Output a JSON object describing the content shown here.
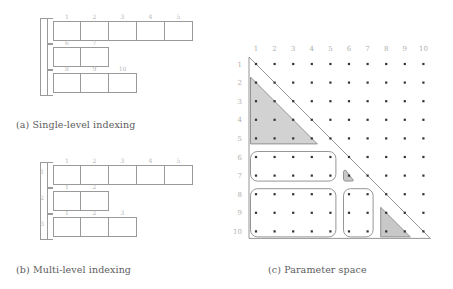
{
  "figure": {
    "panels": [
      {
        "id": "a",
        "caption": "(a) Single-level indexing",
        "rows": [
          {
            "row_label": "",
            "cells": [
              "1",
              "2",
              "3",
              "4",
              "5"
            ]
          },
          {
            "row_label": "",
            "cells": [
              "6",
              "7"
            ]
          },
          {
            "row_label": "",
            "cells": [
              "8",
              "9",
              "10"
            ]
          }
        ]
      },
      {
        "id": "b",
        "caption": "(b) Multi-level indexing",
        "rows": [
          {
            "row_label": "1",
            "cells": [
              "1",
              "2",
              "3",
              "4",
              "5"
            ]
          },
          {
            "row_label": "2",
            "cells": [
              "1",
              "2"
            ]
          },
          {
            "row_label": "3",
            "cells": [
              "1",
              "2",
              "3"
            ]
          }
        ]
      },
      {
        "id": "c",
        "caption": "(c) Parameter space"
      }
    ]
  },
  "chart_data": {
    "type": "scatter",
    "title": "(c) Parameter space",
    "xlabel": "",
    "ylabel": "",
    "grid": false,
    "legend": "none",
    "col_labels": [
      "1",
      "2",
      "3",
      "4",
      "5",
      "6",
      "7",
      "8",
      "9",
      "10"
    ],
    "row_labels": [
      "1",
      "2",
      "3",
      "4",
      "5",
      "6",
      "7",
      "8",
      "9",
      "10"
    ],
    "xlim": [
      1,
      10
    ],
    "ylim": [
      1,
      10
    ],
    "points_note": "10 x 10 lattice of dots, one dot per (row, col) pair",
    "boundary": {
      "type": "triangle",
      "description": "lower-left triangular domain, hypotenuse from (row 1, col 1) to (row 10, col 10)",
      "vertices": [
        [
          1,
          1
        ],
        [
          10,
          1
        ],
        [
          10,
          10
        ]
      ]
    },
    "regions": [
      {
        "name": "shaded-triangle-top-left",
        "shape": "triangle",
        "shaded": true,
        "rows": [
          2,
          5
        ],
        "cols": [
          1,
          4
        ],
        "fill": "#d2d2d2",
        "stroke": "#8a8a8a"
      },
      {
        "name": "rounded-rect-rows-6-7",
        "shape": "rounded-rect",
        "shaded": false,
        "rows": [
          6,
          7
        ],
        "cols": [
          1,
          5
        ],
        "fill": "#ffffff",
        "stroke": "#8a8a8a"
      },
      {
        "name": "shaded-cell-row-7-col-6",
        "shape": "rounded-triangle",
        "shaded": true,
        "rows": [
          7,
          7
        ],
        "cols": [
          6,
          6
        ],
        "fill": "#c8c8c8",
        "stroke": "#8a8a8a"
      },
      {
        "name": "rounded-rect-rows-8-10-cols-1-5",
        "shape": "rounded-rect",
        "shaded": false,
        "rows": [
          8,
          10
        ],
        "cols": [
          1,
          5
        ],
        "fill": "#ffffff",
        "stroke": "#8a8a8a"
      },
      {
        "name": "rounded-rect-rows-8-10-cols-6-7",
        "shape": "rounded-rect",
        "shaded": false,
        "rows": [
          8,
          10
        ],
        "cols": [
          6,
          7
        ],
        "fill": "#ffffff",
        "stroke": "#8a8a8a"
      },
      {
        "name": "shaded-triangle-bottom-right",
        "shape": "triangle",
        "shaded": true,
        "rows": [
          9,
          10
        ],
        "cols": [
          8,
          9
        ],
        "fill": "#c8c8c8",
        "stroke": "#8a8a8a"
      }
    ],
    "colors": {
      "dot": "#333333",
      "shade": "#d2d2d2",
      "stroke": "#8a8a8a",
      "label": "#b0b0b0"
    }
  }
}
